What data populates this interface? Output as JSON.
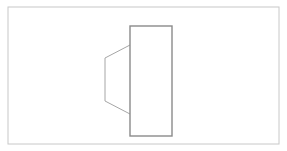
{
  "canvas": {
    "width": 287,
    "height": 151,
    "background_color": "#ffffff",
    "title": "Technical line drawing"
  },
  "frame": {
    "name": "drawing-border",
    "x": 8,
    "y": 7,
    "width": 271,
    "height": 137,
    "stroke_color": "#c8c8c8",
    "stroke_width": 1,
    "fill": "#ffffff"
  },
  "shapes": [
    {
      "id": "block",
      "label": "rectangular-block",
      "type": "rectangle",
      "x": 130,
      "y": 26,
      "width": 42,
      "height": 110,
      "stroke_color": "#8a8a8a",
      "stroke_width": 1.4,
      "fill": "none"
    },
    {
      "id": "taper",
      "label": "tapered-section",
      "type": "polyline",
      "points": "130,45 105,58 105,101 130,114",
      "stroke_color": "#a6a6a6",
      "stroke_width": 1,
      "fill": "none"
    }
  ],
  "vertices": {
    "taper_top_right": [
      130,
      45
    ],
    "taper_top_left": [
      105,
      58
    ],
    "taper_bottom_left": [
      105,
      101
    ],
    "taper_bottom_right": [
      130,
      114
    ],
    "block_top_left": [
      130,
      26
    ],
    "block_top_right": [
      172,
      26
    ],
    "block_bottom_right": [
      172,
      136
    ],
    "block_bottom_left": [
      130,
      136
    ]
  }
}
